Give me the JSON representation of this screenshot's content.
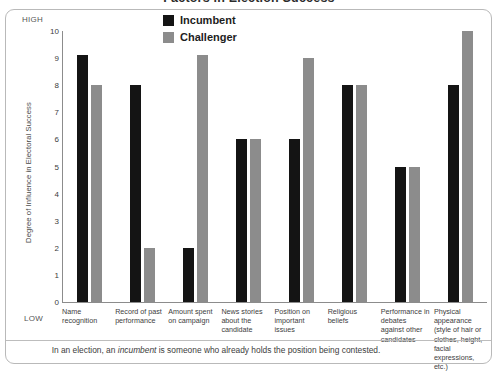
{
  "title": "Factors in Election Success",
  "axis": {
    "high_label": "HIGH",
    "low_label": "LOW",
    "y_title": "Degree of Influence in Electoral Success",
    "y_ticks": [
      "10",
      "9",
      "8",
      "7",
      "6",
      "5",
      "4",
      "3",
      "2",
      "1",
      "0"
    ]
  },
  "legend": {
    "incumbent": "Incumbent",
    "challenger": "Challenger"
  },
  "footnote": {
    "before": "In an election, an ",
    "emphasis": "incumbent",
    "after": " is someone who already holds the position being contested."
  },
  "colors": {
    "incumbent": "#141414",
    "challenger": "#8c8c8c",
    "axis": "#8c8c8c",
    "frame": "#b9b9b9"
  },
  "chart_data": {
    "type": "bar",
    "title": "Factors in Election Success",
    "xlabel": "",
    "ylabel": "Degree of Influence in Electoral Success",
    "ylim": [
      0,
      10
    ],
    "yticks": [
      0,
      1,
      2,
      3,
      4,
      5,
      6,
      7,
      8,
      9,
      10
    ],
    "grid": false,
    "legend_position": "top-center",
    "categories": [
      "Name recognition",
      "Record of past performance",
      "Amount spent on campaign",
      "News stories about the candidate",
      "Position on important issues",
      "Religious beliefs",
      "Performance in debates against other candidates",
      "Physical appearance (style of hair or clothes, height, facial expressions, etc.)"
    ],
    "series": [
      {
        "name": "Incumbent",
        "color": "#141414",
        "values": [
          9.1,
          8,
          2,
          6,
          6,
          8,
          5,
          8
        ]
      },
      {
        "name": "Challenger",
        "color": "#8c8c8c",
        "values": [
          8,
          2,
          9.1,
          6,
          9,
          8,
          5,
          10
        ]
      }
    ]
  }
}
